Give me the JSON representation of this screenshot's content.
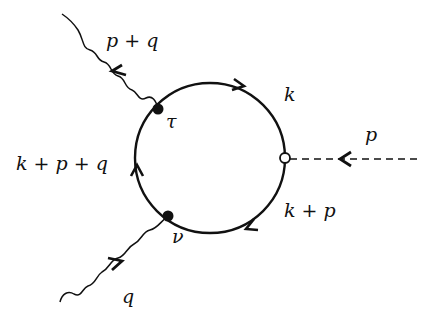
{
  "diagram": {
    "type": "feynman-triangle-loop",
    "loop": {
      "center": [
        210,
        158
      ],
      "radius": 75,
      "propagators": [
        {
          "id": "k",
          "label": "k",
          "arrow": "clockwise-top"
        },
        {
          "id": "k_plus_p",
          "label": "k + p",
          "arrow": "bottom-right"
        },
        {
          "id": "k_plus_p_plus_q",
          "label": "k + p + q",
          "arrow": "left-upward"
        }
      ]
    },
    "vertices": [
      {
        "id": "tau",
        "label": "τ",
        "style": "filled"
      },
      {
        "id": "nu",
        "label": "ν",
        "style": "filled"
      },
      {
        "id": "scalar",
        "label": "",
        "style": "open"
      }
    ],
    "external_lines": [
      {
        "id": "photon_out",
        "label": "p + q",
        "style": "wavy",
        "vertex": "tau",
        "direction": "outgoing"
      },
      {
        "id": "photon_in",
        "label": "q",
        "style": "wavy",
        "vertex": "nu",
        "direction": "incoming"
      },
      {
        "id": "scalar_in",
        "label": "p",
        "style": "dashed",
        "vertex": "scalar",
        "direction": "incoming"
      }
    ]
  }
}
